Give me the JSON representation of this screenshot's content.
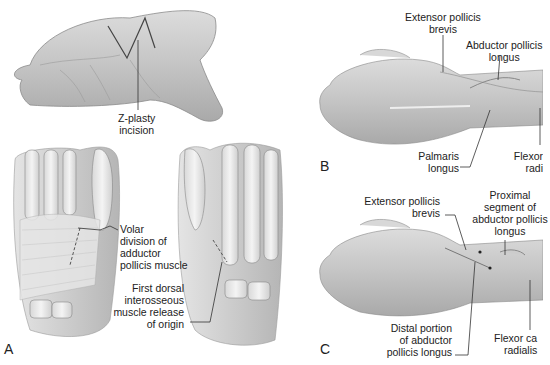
{
  "figure": {
    "panels": [
      {
        "id": "A",
        "label": "A",
        "callouts": [
          {
            "id": "z-plasty",
            "lines": [
              "Z-plasty",
              "incision"
            ]
          },
          {
            "id": "volar-division",
            "lines": [
              "Volar",
              "division of",
              "adductor",
              "pollicis muscle"
            ]
          },
          {
            "id": "first-dorsal",
            "lines": [
              "First dorsal",
              "interosseous",
              "muscle release",
              "of origin"
            ]
          }
        ]
      },
      {
        "id": "B",
        "label": "B",
        "callouts": [
          {
            "id": "epb",
            "lines": [
              "Extensor pollicis",
              "brevis"
            ]
          },
          {
            "id": "apl",
            "lines": [
              "Abductor pollicis",
              "longus"
            ]
          },
          {
            "id": "palmaris",
            "lines": [
              "Palmaris",
              "longus"
            ]
          },
          {
            "id": "fcr",
            "lines": [
              "Flexor",
              "radi"
            ]
          }
        ]
      },
      {
        "id": "C",
        "label": "C",
        "callouts": [
          {
            "id": "epb",
            "lines": [
              "Extensor pollicis",
              "brevis"
            ]
          },
          {
            "id": "proximal-apl",
            "lines": [
              "Proximal",
              "segment of",
              "abductor pollicis",
              "longus"
            ]
          },
          {
            "id": "distal-apl",
            "lines": [
              "Distal portion",
              "of abductor",
              "pollicis longus"
            ]
          },
          {
            "id": "fcr",
            "lines": [
              "Flexor ca",
              "radialis"
            ]
          }
        ]
      }
    ]
  }
}
